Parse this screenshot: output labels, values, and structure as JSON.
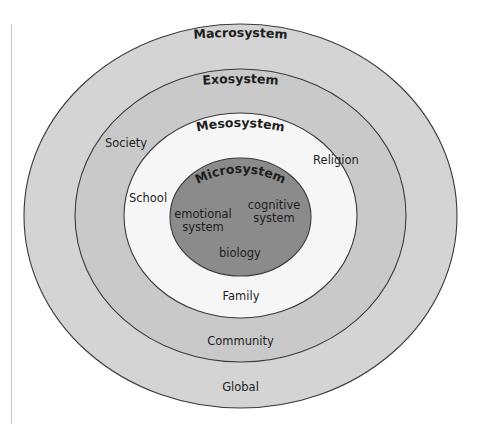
{
  "diagram": {
    "colors": {
      "macrosystem_fill": "#d4d4d4",
      "exosystem_fill": "#c9c9c9",
      "mesosystem_fill": "#f6f6f6",
      "microsystem_fill": "#8b8b8b",
      "stroke": "#3a3a3a",
      "text": "#1e1e1e",
      "page_rule": "#c4c4c4"
    },
    "layers": [
      {
        "id": "macrosystem",
        "label": "Macrosystem",
        "items": [
          "Global"
        ]
      },
      {
        "id": "exosystem",
        "label": "Exosystem",
        "items": [
          "Society",
          "Community"
        ]
      },
      {
        "id": "mesosystem",
        "label": "Mesosystem",
        "items": [
          "Religion",
          "School",
          "Family"
        ]
      },
      {
        "id": "microsystem",
        "label": "Microsystem",
        "items": [
          "emotional system",
          "cognitive system",
          "biology"
        ]
      }
    ],
    "labels": {
      "macrosystem": "Macrosystem",
      "exosystem": "Exosystem",
      "mesosystem": "Mesosystem",
      "microsystem": "Microsystem",
      "global": "Global",
      "society": "Society",
      "community": "Community",
      "religion": "Religion",
      "school": "School",
      "family": "Family",
      "emotional_line1": "emotional",
      "emotional_line2": "system",
      "cognitive_line1": "cognitive",
      "cognitive_line2": "system",
      "biology": "biology"
    }
  }
}
